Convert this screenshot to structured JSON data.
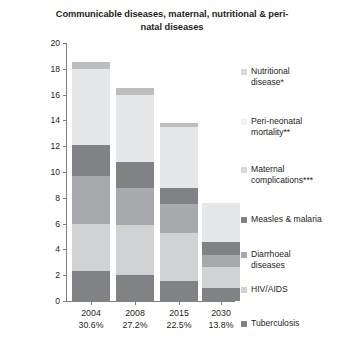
{
  "chart_data": {
    "type": "bar",
    "subtype": "stacked-bar",
    "title": "Communicable diseases, maternal, nutritional & peri-natal diseases",
    "xlabel": "",
    "ylabel": "Percent",
    "ylim": [
      0,
      20
    ],
    "ytick_values": [
      0,
      2,
      4,
      6,
      8,
      10,
      12,
      14,
      16,
      18,
      20
    ],
    "grid": false,
    "legend_position": "right",
    "categories": [
      "2004",
      "2008",
      "2015",
      "2030"
    ],
    "category_sublabels": [
      "30.6%",
      "27.2%",
      "22.5%",
      "13.8%"
    ],
    "series": [
      {
        "name": "Tuberculosis",
        "color": "#808285",
        "values": [
          2.35,
          2.05,
          1.55,
          1.0
        ]
      },
      {
        "name": "HIV/AIDS",
        "color": "#d0d2d3",
        "values": [
          3.65,
          3.85,
          3.75,
          1.6
        ]
      },
      {
        "name": "Diarrhoeal diseases",
        "color": "#a7a9ac",
        "values": [
          3.7,
          2.9,
          2.2,
          1.0
        ]
      },
      {
        "name": "Measles & malaria",
        "color": "#808285",
        "values": [
          2.4,
          2.0,
          1.3,
          0.95
        ]
      },
      {
        "name": "Maternal complications***",
        "color": "#e6e7e8",
        "values": [
          5.9,
          5.2,
          4.7,
          3.05
        ]
      },
      {
        "name": "Peri-neonatal mortality**",
        "color": "#bcbec0",
        "values": [
          0.5,
          0.5,
          0.3,
          0.0
        ]
      },
      {
        "name": "Nutritional disease*",
        "color": "#bcbec0",
        "values": [
          0.0,
          0.0,
          0.0,
          0.0
        ]
      }
    ],
    "totals": [
      18.5,
      16.5,
      13.8,
      7.6
    ],
    "legend_entries": [
      {
        "label_line1": "Nutritional",
        "label_line2": "disease*",
        "color": "#d9dadb",
        "has_swatch": true
      },
      {
        "label_line1": "Peri-neonatal",
        "label_line2": "mortality**",
        "color": "#f1f1f2",
        "has_swatch": false
      },
      {
        "label_line1": "Maternal",
        "label_line2": "complications***",
        "color": "#d9dadb",
        "has_swatch": true
      },
      {
        "label_line1": "Measles & malaria",
        "label_line2": "",
        "color": "#808285",
        "has_swatch": true
      },
      {
        "label_line1": "Diarrhoeal",
        "label_line2": "diseases",
        "color": "#a7a9ac",
        "has_swatch": true
      },
      {
        "label_line1": "HIV/AIDS",
        "label_line2": "",
        "color": "#d0d2d3",
        "has_swatch": true
      },
      {
        "label_line1": "Tuberculosis",
        "label_line2": "",
        "color": "#808285",
        "has_swatch": true
      }
    ]
  }
}
